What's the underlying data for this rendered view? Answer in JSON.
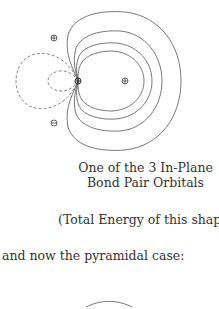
{
  "figure": {
    "type": "orbital-contour-plot",
    "markers": [
      {
        "symbol": "⊕",
        "role": "top-nucleus"
      },
      {
        "symbol": "⊖",
        "role": "bottom-nucleus"
      },
      {
        "symbol": "⊕",
        "role": "right-nucleus"
      },
      {
        "symbol": "⊕",
        "role": "central-atom"
      }
    ],
    "solid_contours": 4,
    "dashed_contours": 2
  },
  "caption": {
    "line1": "One of the 3 In-Plane",
    "line2": "Bond Pair Orbitals"
  },
  "energy_note": "(Total Energy of this shape",
  "transition_text": "and now the pyramidal case:"
}
